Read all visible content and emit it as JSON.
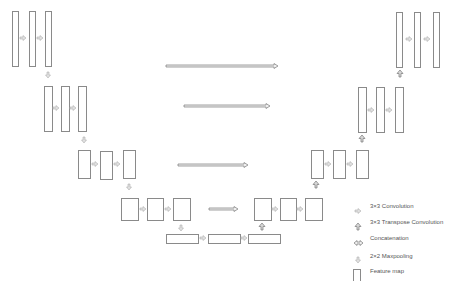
{
  "diagram": {
    "colors": {
      "stroke": "#8a8a8a",
      "fill": "#ffffff",
      "arrow_fill": "#e0e0e0",
      "text": "#555555"
    },
    "feature_maps": [
      {
        "id": "e1a",
        "x": 12,
        "y": 11,
        "w": 6,
        "h": 55
      },
      {
        "id": "e1b",
        "x": 29,
        "y": 11,
        "w": 6,
        "h": 55
      },
      {
        "id": "e1c",
        "x": 45,
        "y": 11,
        "w": 6,
        "h": 55
      },
      {
        "id": "e2a",
        "x": 44,
        "y": 86,
        "w": 8,
        "h": 45
      },
      {
        "id": "e2b",
        "x": 61,
        "y": 86,
        "w": 8,
        "h": 45
      },
      {
        "id": "e2c",
        "x": 78,
        "y": 86,
        "w": 8,
        "h": 45
      },
      {
        "id": "e3a",
        "x": 78,
        "y": 150,
        "w": 12,
        "h": 28
      },
      {
        "id": "e3b",
        "x": 100,
        "y": 151,
        "w": 12,
        "h": 28
      },
      {
        "id": "e3c",
        "x": 123,
        "y": 150,
        "w": 12,
        "h": 28
      },
      {
        "id": "e4a",
        "x": 121,
        "y": 198,
        "w": 17,
        "h": 22
      },
      {
        "id": "e4b",
        "x": 147,
        "y": 198,
        "w": 16,
        "h": 22
      },
      {
        "id": "e4c",
        "x": 173,
        "y": 198,
        "w": 17,
        "h": 22
      },
      {
        "id": "b1",
        "x": 166,
        "y": 234,
        "w": 32,
        "h": 9
      },
      {
        "id": "b2",
        "x": 208,
        "y": 234,
        "w": 32,
        "h": 9
      },
      {
        "id": "b3",
        "x": 248,
        "y": 234,
        "w": 32,
        "h": 9
      },
      {
        "id": "d4a",
        "x": 254,
        "y": 198,
        "w": 17,
        "h": 22
      },
      {
        "id": "d4b",
        "x": 280,
        "y": 198,
        "w": 16,
        "h": 22
      },
      {
        "id": "d4c",
        "x": 305,
        "y": 198,
        "w": 17,
        "h": 22
      },
      {
        "id": "d3a",
        "x": 311,
        "y": 150,
        "w": 12,
        "h": 28
      },
      {
        "id": "d3b",
        "x": 333,
        "y": 150,
        "w": 12,
        "h": 28
      },
      {
        "id": "d3c",
        "x": 356,
        "y": 150,
        "w": 12,
        "h": 28
      },
      {
        "id": "d2a",
        "x": 358,
        "y": 87,
        "w": 8,
        "h": 45
      },
      {
        "id": "d2b",
        "x": 376,
        "y": 87,
        "w": 8,
        "h": 45
      },
      {
        "id": "d2c",
        "x": 395,
        "y": 87,
        "w": 8,
        "h": 45
      },
      {
        "id": "d1a",
        "x": 396,
        "y": 12,
        "w": 6,
        "h": 55
      },
      {
        "id": "d1b",
        "x": 414,
        "y": 12,
        "w": 6,
        "h": 55
      },
      {
        "id": "d1c",
        "x": 433,
        "y": 12,
        "w": 6,
        "h": 55
      }
    ],
    "conv_arrows": [
      {
        "x": 20,
        "y": 38
      },
      {
        "x": 37,
        "y": 38
      },
      {
        "x": 53,
        "y": 108
      },
      {
        "x": 70,
        "y": 108
      },
      {
        "x": 92,
        "y": 164
      },
      {
        "x": 114,
        "y": 164
      },
      {
        "x": 140,
        "y": 209
      },
      {
        "x": 165,
        "y": 209
      },
      {
        "x": 200,
        "y": 238
      },
      {
        "x": 241,
        "y": 238
      },
      {
        "x": 272,
        "y": 209
      },
      {
        "x": 297,
        "y": 209
      },
      {
        "x": 325,
        "y": 164
      },
      {
        "x": 347,
        "y": 164
      },
      {
        "x": 368,
        "y": 110
      },
      {
        "x": 386,
        "y": 110
      },
      {
        "x": 406,
        "y": 39
      },
      {
        "x": 424,
        "y": 39
      }
    ],
    "pool_arrows": [
      {
        "x": 48,
        "y": 72
      },
      {
        "x": 84,
        "y": 137
      },
      {
        "x": 129,
        "y": 184
      },
      {
        "x": 181,
        "y": 225
      }
    ],
    "up_arrows": [
      {
        "x": 262,
        "y": 223
      },
      {
        "x": 316,
        "y": 181
      },
      {
        "x": 362,
        "y": 135
      },
      {
        "x": 400,
        "y": 70
      }
    ],
    "skip_connections": [
      {
        "x1": 166,
        "x2": 278,
        "y": 66
      },
      {
        "x1": 184,
        "x2": 270,
        "y": 106
      },
      {
        "x1": 178,
        "x2": 248,
        "y": 165
      },
      {
        "x1": 209,
        "x2": 238,
        "y": 209
      }
    ]
  },
  "legend": {
    "items": [
      {
        "icon": "conv-arrow",
        "label": "3×3 Convolution",
        "y": 0
      },
      {
        "icon": "up-arrow",
        "label": "3×3 Transpose Convolution",
        "y": 16
      },
      {
        "icon": "concat-arrow",
        "label": "Concatenation",
        "y": 32
      },
      {
        "icon": "pool-arrow",
        "label": "2×2 Maxpooling",
        "y": 50
      },
      {
        "icon": "feature-map",
        "label": "Feature map",
        "y": 65
      }
    ]
  }
}
